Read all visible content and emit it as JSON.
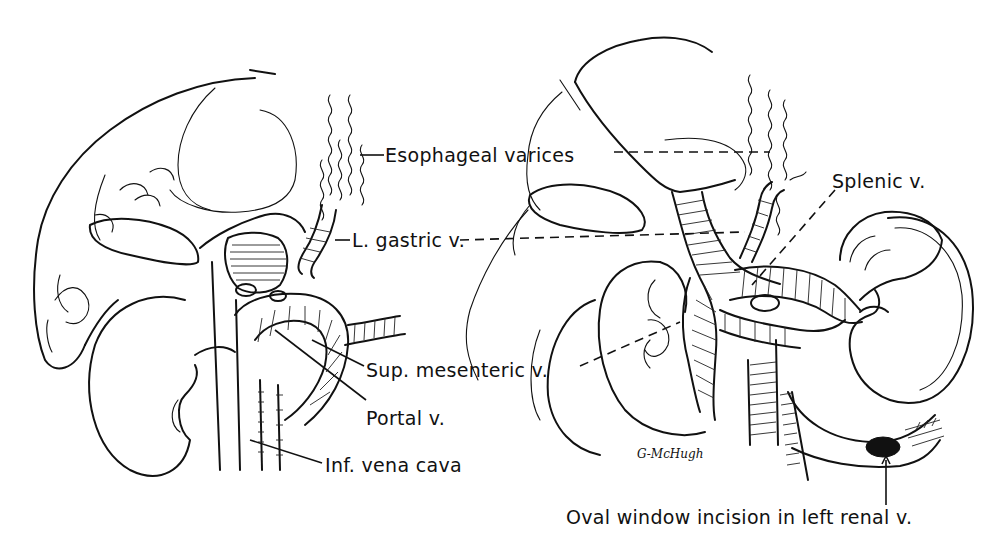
{
  "figure": {
    "ink_color": "#111111",
    "background": "#ffffff",
    "labels": {
      "esophageal_varices": "Esophageal varices",
      "left_gastric_vein": "L. gastric v.",
      "splenic_vein": "Splenic v.",
      "sup_mesenteric_vein": "Sup. mesenteric v.",
      "portal_vein": "Portal v.",
      "inf_vena_cava": "Inf. vena cava",
      "oval_window": "Oval window incision in left renal v."
    },
    "signature": "G-McHugh",
    "panels": [
      {
        "name": "left-panel",
        "description": "Liver, stomach, kidney and portal system before shunt"
      },
      {
        "name": "right-panel",
        "description": "Splenorenal shunt with spleen and kidney"
      },
      {
        "name": "inset",
        "description": "Detail of oval window incision in left renal vein"
      }
    ]
  }
}
